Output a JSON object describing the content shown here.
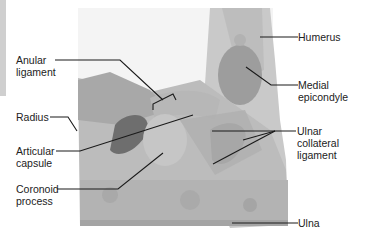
{
  "figure": {
    "labels": {
      "anular_ligament": {
        "line1": "Anular",
        "line2": "ligament"
      },
      "radius": "Radius",
      "articular_capsule": {
        "line1": "Articular",
        "line2": "capsule"
      },
      "coronoid_process": {
        "line1": "Coronoid",
        "line2": "process"
      },
      "humerus": "Humerus",
      "medial_epicondyle": {
        "line1": "Medial",
        "line2": "epicondyle"
      },
      "ulnar_collateral_ligament": {
        "line1": "Ulnar",
        "line2": "collateral",
        "line3": "ligament"
      },
      "ulna": "Ulna"
    },
    "colors": {
      "background": "#ffffff",
      "specimen_light": "#d2d2d2",
      "specimen_mid": "#a9a9a9",
      "specimen_dark": "#6e6e6e",
      "leader_line": "#1a1a1a",
      "text": "#222222"
    }
  }
}
